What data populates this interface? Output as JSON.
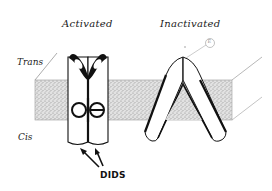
{
  "diagram": {
    "labels": {
      "activated": "Activated",
      "inactivated": "Inactivated",
      "trans": "Trans",
      "cis": "Cis",
      "dids": "DIDS",
      "circled_marker": "E"
    },
    "colors": {
      "membrane_fill": "#d4d4d4",
      "ink": "#111111",
      "background": "#ffffff"
    },
    "elements": [
      {
        "id": "membrane",
        "type": "lipid bilayer slab (stippled)"
      },
      {
        "id": "activated-channel",
        "type": "pair of upright cylinders with Y-shaped open pore tops and DIDS-bound rings"
      },
      {
        "id": "inactivated-channel",
        "type": "inverted V pair of cylinders crossing membrane"
      },
      {
        "id": "dids-arrows",
        "type": "two arrows pointing to activated channel binding sites"
      }
    ]
  }
}
